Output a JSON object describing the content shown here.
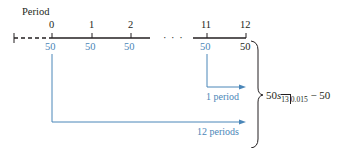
{
  "diagram": {
    "title": "Period",
    "period_labels": [
      "0",
      "1",
      "2",
      "11",
      "12"
    ],
    "payments": [
      "50",
      "50",
      "50",
      "50",
      "50"
    ],
    "ellipsis": "· · ·",
    "arrows": [
      {
        "label": "1 period",
        "from": "11",
        "to": "12"
      },
      {
        "label": "12 periods",
        "from": "0",
        "to": "12"
      }
    ],
    "formula": {
      "coef": "50",
      "symbol": "s",
      "angle_n": "13",
      "rate": "0.015",
      "minus": " − 50"
    },
    "colors": {
      "ink": "#231f20",
      "accent": "#4a86b8"
    }
  }
}
